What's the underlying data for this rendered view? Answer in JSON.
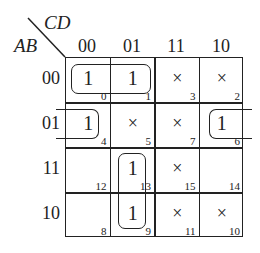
{
  "kmap": {
    "row_variables": "AB",
    "col_variables": "CD",
    "col_headers": [
      "00",
      "01",
      "11",
      "10"
    ],
    "row_headers": [
      "00",
      "01",
      "11",
      "10"
    ],
    "cells": [
      [
        {
          "value": "1",
          "index": "0"
        },
        {
          "value": "1",
          "index": "1"
        },
        {
          "value": "×",
          "index": "3"
        },
        {
          "value": "×",
          "index": "2"
        }
      ],
      [
        {
          "value": "1",
          "index": "4"
        },
        {
          "value": "×",
          "index": "5"
        },
        {
          "value": "×",
          "index": "7"
        },
        {
          "value": "1",
          "index": "6"
        }
      ],
      [
        {
          "value": "",
          "index": "12"
        },
        {
          "value": "1",
          "index": "13"
        },
        {
          "value": "×",
          "index": "15"
        },
        {
          "value": "",
          "index": "14"
        }
      ],
      [
        {
          "value": "",
          "index": "8"
        },
        {
          "value": "1",
          "index": "9"
        },
        {
          "value": "×",
          "index": "11"
        },
        {
          "value": "×",
          "index": "10"
        }
      ]
    ],
    "groupings": [
      {
        "cells": [
          "m0",
          "m1"
        ],
        "description": "A'B'C'"
      },
      {
        "cells": [
          "m4",
          "m6"
        ],
        "description": "A'BD' (wrap-around)"
      },
      {
        "cells": [
          "m13",
          "m9"
        ],
        "description": "AC'D"
      }
    ]
  }
}
